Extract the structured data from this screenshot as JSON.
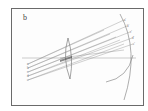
{
  "figure": {
    "panel_label": "b",
    "colors": {
      "frame": "#6a6a6a",
      "rays": "#8a8a8a",
      "lens": "#666666",
      "curve": "#777777",
      "background": "#fdfdfd"
    },
    "object_points": [
      "a",
      "b",
      "c",
      "d",
      "e"
    ],
    "image_points": [
      "a'",
      "b'",
      "c'",
      "d'",
      "e'"
    ],
    "elements": [
      "optical-axis",
      "lens",
      "ray-fan",
      "image-curve",
      "focal-curve"
    ]
  }
}
